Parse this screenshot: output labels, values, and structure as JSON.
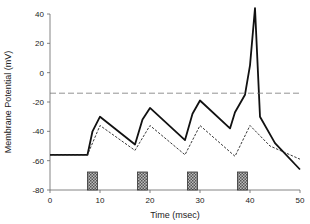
{
  "chart_data": {
    "type": "line",
    "title": "",
    "xlabel": "Time (msec)",
    "ylabel": "Membrane Potential (mV)",
    "xlim": [
      0,
      50
    ],
    "ylim": [
      -80,
      40
    ],
    "xticks": [
      "0",
      "10",
      "20",
      "30",
      "40",
      "50"
    ],
    "yticks": [
      "40",
      "20",
      "0",
      "-20",
      "-40",
      "-60",
      "-80"
    ],
    "grid": false,
    "legend": null,
    "series": [
      {
        "name": "membrane potential (solid)",
        "style": "solid",
        "x": [
          0,
          7.5,
          8.5,
          10,
          17,
          18.5,
          20,
          27,
          28.5,
          30,
          36,
          37,
          39,
          40,
          41,
          42,
          45,
          50
        ],
        "y": [
          -56,
          -56,
          -40,
          -30,
          -49,
          -32,
          -24,
          -46,
          -28,
          -19,
          -38,
          -27,
          -15,
          5,
          44,
          -30,
          -48,
          -66
        ]
      },
      {
        "name": "subthreshold potential (dashed)",
        "style": "dotted",
        "x": [
          0,
          7.5,
          10,
          17,
          20,
          27,
          30,
          37,
          40,
          44,
          50
        ],
        "y": [
          -56,
          -56,
          -36,
          -53,
          -36,
          -56,
          -36,
          -57,
          -36,
          -50,
          -59
        ]
      },
      {
        "name": "threshold",
        "style": "dashed",
        "x": [
          0,
          50
        ],
        "y": [
          -14,
          -14
        ]
      }
    ],
    "stimuli": [
      {
        "start": 7.5,
        "end": 9.5
      },
      {
        "start": 17.5,
        "end": 19.5
      },
      {
        "start": 27.5,
        "end": 29.5
      },
      {
        "start": 37.5,
        "end": 39.5
      }
    ]
  }
}
